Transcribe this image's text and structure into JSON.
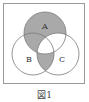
{
  "figure": {
    "caption": "図1",
    "labels": {
      "a": "A",
      "b": "B",
      "c": "C"
    },
    "colors": {
      "shade": "#a9a9a9",
      "stroke": "#7a7a7a",
      "frame": "#9a9a9a",
      "background": "#ffffff"
    },
    "shaded_regions": [
      "A only",
      "A∩B not C",
      "B∩C not A"
    ],
    "unshaded_regions": [
      "A∩C not B",
      "A∩B∩C",
      "B only",
      "C only"
    ]
  }
}
